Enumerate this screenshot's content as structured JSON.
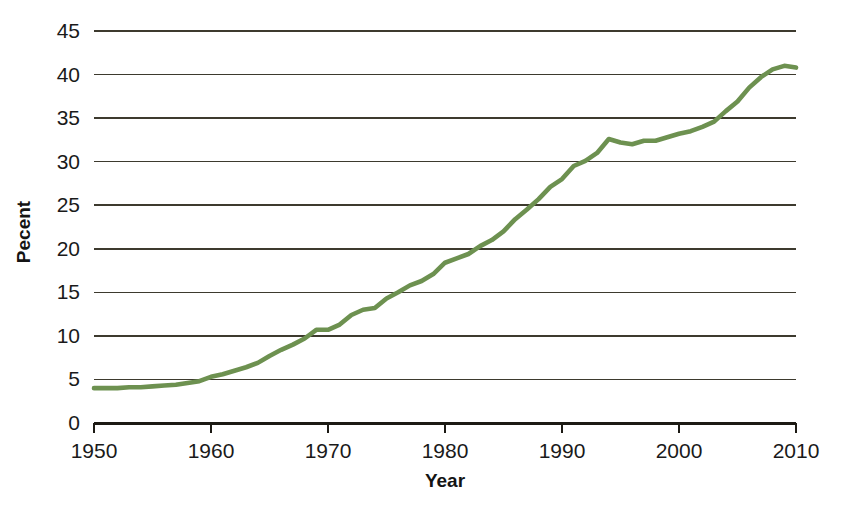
{
  "chart_data": {
    "type": "line",
    "title": "",
    "xlabel": "Year",
    "ylabel": "Pecent",
    "xlim": [
      1950,
      2010
    ],
    "ylim": [
      0,
      45
    ],
    "grid": true,
    "legend": false,
    "legend_position": "none",
    "line_color": "#6d9150",
    "x_ticks": [
      1950,
      1960,
      1970,
      1980,
      1990,
      2000,
      2010
    ],
    "x_tick_labels": [
      "1950",
      "1960",
      "1970",
      "1980",
      "1990",
      "2000",
      "2010"
    ],
    "y_ticks": [
      0,
      5,
      10,
      15,
      20,
      25,
      30,
      35,
      40,
      45
    ],
    "y_tick_labels": [
      "0",
      "5",
      "10",
      "15",
      "20",
      "25",
      "30",
      "35",
      "40",
      "45"
    ],
    "series": [
      {
        "name": "Percent",
        "x": [
          1950,
          1951,
          1952,
          1953,
          1954,
          1955,
          1956,
          1957,
          1958,
          1959,
          1960,
          1961,
          1962,
          1963,
          1964,
          1965,
          1966,
          1967,
          1968,
          1969,
          1970,
          1971,
          1972,
          1973,
          1974,
          1975,
          1976,
          1977,
          1978,
          1979,
          1980,
          1981,
          1982,
          1983,
          1984,
          1985,
          1986,
          1987,
          1988,
          1989,
          1990,
          1991,
          1992,
          1993,
          1994,
          1995,
          1996,
          1997,
          1998,
          1999,
          2000,
          2001,
          2002,
          2003,
          2004,
          2005,
          2006,
          2007,
          2008,
          2009,
          2010
        ],
        "values": [
          4.0,
          4.0,
          4.0,
          4.1,
          4.1,
          4.2,
          4.3,
          4.4,
          4.6,
          4.8,
          5.3,
          5.6,
          6.0,
          6.4,
          6.9,
          7.7,
          8.4,
          9.0,
          9.7,
          10.7,
          10.7,
          11.3,
          12.4,
          13.0,
          13.2,
          14.3,
          15.0,
          15.8,
          16.3,
          17.1,
          18.4,
          18.9,
          19.4,
          20.3,
          21.0,
          22.0,
          23.4,
          24.5,
          25.7,
          27.1,
          28.0,
          29.5,
          30.1,
          31.0,
          32.6,
          32.2,
          32.0,
          32.4,
          32.4,
          32.8,
          33.2,
          33.5,
          34.0,
          34.6,
          35.8,
          36.9,
          38.5,
          39.7,
          40.6,
          41.0,
          40.8
        ]
      }
    ]
  },
  "axes": {
    "x_title": "Year",
    "y_title": "Pecent"
  }
}
